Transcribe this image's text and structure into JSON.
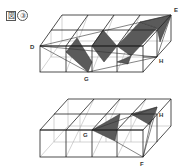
{
  "figure": {
    "title_kanji": "図",
    "title_number": "③"
  },
  "top_figure": {
    "labels": {
      "D": "D",
      "E": "E",
      "G": "G",
      "H": "H"
    },
    "colors": {
      "line": "#222222",
      "hidden_line": "#aaaaaa",
      "shade": "#555555"
    }
  },
  "bottom_figure": {
    "labels": {
      "G": "G",
      "H": "H",
      "F": "F"
    },
    "colors": {
      "line": "#222222",
      "hidden_line": "#aaaaaa",
      "shade": "#555555"
    }
  }
}
